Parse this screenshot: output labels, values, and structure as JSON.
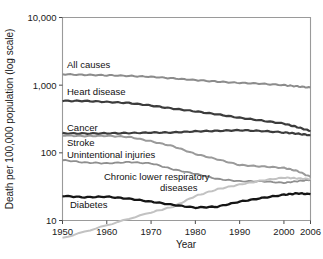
{
  "chart_data": {
    "type": "line",
    "title": "",
    "xlabel": "Year",
    "ylabel": "Death per 100,000 population (log scale)",
    "yscale": "log",
    "ylim": [
      10,
      10000
    ],
    "xlim": [
      1950,
      2006
    ],
    "grid": false,
    "legend_position": "inline-labels",
    "ytick_labels": [
      "10,000",
      "1,000",
      "100",
      "10"
    ],
    "ytick_values": [
      10000,
      1000,
      100,
      10
    ],
    "xtick_labels": [
      "1950",
      "1960",
      "1970",
      "1980",
      "1990",
      "2000",
      "2006"
    ],
    "xtick_values": [
      1950,
      1960,
      1970,
      1980,
      1990,
      2000,
      2006
    ],
    "series": [
      {
        "name": "All causes",
        "label": "All causes",
        "color": "#8c8c8c",
        "width": 2.0,
        "x": [
          1950,
          1955,
          1960,
          1965,
          1970,
          1975,
          1980,
          1985,
          1990,
          1995,
          2000,
          2003,
          2006
        ],
        "values": [
          1446,
          1420,
          1400,
          1370,
          1330,
          1260,
          1190,
          1130,
          1080,
          1050,
          1000,
          960,
          920
        ]
      },
      {
        "name": "Heart disease",
        "label": "Heart disease",
        "color": "#3c3c3c",
        "width": 2.2,
        "x": [
          1950,
          1955,
          1960,
          1965,
          1970,
          1975,
          1980,
          1985,
          1990,
          1995,
          2000,
          2003,
          2006
        ],
        "values": [
          586,
          585,
          565,
          545,
          500,
          450,
          410,
          370,
          330,
          300,
          270,
          240,
          210
        ]
      },
      {
        "name": "Cancer",
        "label": "Cancer",
        "color": "#3c3c3c",
        "width": 2.2,
        "x": [
          1950,
          1955,
          1960,
          1965,
          1970,
          1975,
          1980,
          1985,
          1990,
          1995,
          2000,
          2003,
          2006
        ],
        "values": [
          194,
          193,
          194,
          196,
          199,
          200,
          208,
          211,
          216,
          210,
          200,
          192,
          182
        ]
      },
      {
        "name": "Stroke",
        "label": "Stroke",
        "color": "#9a9a9a",
        "width": 2.0,
        "x": [
          1950,
          1955,
          1960,
          1965,
          1970,
          1975,
          1980,
          1985,
          1990,
          1995,
          2000,
          2003,
          2006
        ],
        "values": [
          181,
          177,
          178,
          172,
          148,
          125,
          96,
          80,
          66,
          63,
          60,
          54,
          44
        ]
      },
      {
        "name": "Unintentional injuries",
        "label": "Unintentional injuries",
        "color": "#8f8f8f",
        "width": 1.8,
        "x": [
          1950,
          1955,
          1960,
          1965,
          1970,
          1975,
          1980,
          1985,
          1990,
          1995,
          2000,
          2003,
          2006
        ],
        "values": [
          78,
          72,
          70,
          73,
          70,
          57,
          49,
          41,
          38,
          38,
          36,
          38,
          40
        ]
      },
      {
        "name": "Chronic lower respiratory diseases",
        "label": "Chronic lower respiratory diseases",
        "color": "#c2c2c2",
        "width": 2.0,
        "x": [
          1950,
          1960,
          1970,
          1975,
          1980,
          1985,
          1990,
          1995,
          2000,
          2003,
          2006
        ],
        "values": [
          5.5,
          8.5,
          13.2,
          16.0,
          23.0,
          29.0,
          34.0,
          39.0,
          43.0,
          42.0,
          41.0
        ]
      },
      {
        "name": "Diabetes",
        "label": "Diabetes",
        "color": "#151515",
        "width": 2.3,
        "x": [
          1950,
          1955,
          1960,
          1965,
          1970,
          1975,
          1980,
          1985,
          1990,
          1995,
          2000,
          2003,
          2006
        ],
        "values": [
          23.1,
          22.0,
          22.5,
          21.0,
          19.0,
          17.0,
          15.5,
          16.0,
          19.0,
          21.5,
          24.0,
          25.2,
          24.5
        ]
      }
    ],
    "annotations": [
      {
        "name": "all-causes",
        "text": "All causes",
        "x_px": 67,
        "y_px": 68
      },
      {
        "name": "heart-disease",
        "text": "Heart disease",
        "x_px": 67,
        "y_px": 95
      },
      {
        "name": "cancer",
        "text": "Cancer",
        "x_px": 67,
        "y_px": 131
      },
      {
        "name": "stroke",
        "text": "Stroke",
        "x_px": 67,
        "y_px": 146
      },
      {
        "name": "unintentional-injuries",
        "text": "Unintentional injuries",
        "x_px": 67,
        "y_px": 158
      },
      {
        "name": "clrd-line1",
        "text": "Chronic lower respiratory",
        "x_px": 104,
        "y_px": 180
      },
      {
        "name": "clrd-line2",
        "text": "diseases",
        "x_px": 160,
        "y_px": 191
      },
      {
        "name": "diabetes",
        "text": "Diabetes",
        "x_px": 70,
        "y_px": 208
      }
    ]
  }
}
